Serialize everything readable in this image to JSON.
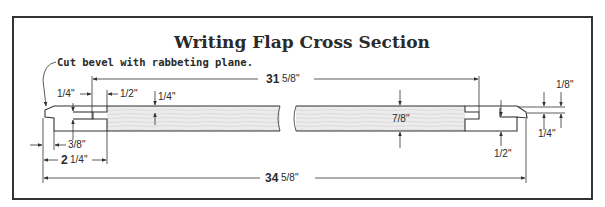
{
  "title": "Writing Flap Cross Section",
  "note": "Cut bevel with rabbeting plane.",
  "dimensions": {
    "inner_length": "31⅝\"",
    "inner_length_whole": "31",
    "inner_length_frac": "5/8\"",
    "overall_length": "34⅝\"",
    "overall_length_whole": "34",
    "overall_length_frac": "5/8\"",
    "breadboard_width": "2¼\"",
    "breadboard_width_whole": "2",
    "breadboard_width_frac": "1/4\"",
    "thickness": "7/8\"",
    "left_tongue_gap": "1/4\"",
    "left_tenon_length": "1/2\"",
    "left_tenon_thickness": "1/4\"",
    "left_bevel_offset": "3/8\"",
    "right_top": "1/8\"",
    "right_lip": "1/4\"",
    "right_bottom": "1/2\""
  },
  "colors": {
    "frame": "#333333",
    "board_light": "#e6e6e6",
    "board_grain": "#cfcfcf",
    "end_piece": "#d9d9d9",
    "ink": "#2a2a2a"
  }
}
